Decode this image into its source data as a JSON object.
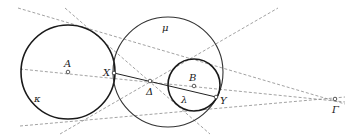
{
  "diagram": {
    "title": "",
    "circles": [
      {
        "id": "kappa",
        "label": "κ",
        "cx": 68,
        "cy": 72,
        "r": 47
      },
      {
        "id": "mu",
        "label": "μ",
        "cx": 168,
        "cy": 72,
        "r": 55
      },
      {
        "id": "lambda",
        "label": "λ",
        "cx": 194,
        "cy": 85,
        "r": 26
      }
    ],
    "points": {
      "A": {
        "label": "A",
        "x": 68,
        "y": 72
      },
      "B": {
        "label": "B",
        "x": 194,
        "y": 86
      },
      "X": {
        "label": "X",
        "x": 114,
        "y": 73
      },
      "Y": {
        "label": "Y",
        "x": 216,
        "y": 97
      },
      "Delta": {
        "label": "Δ",
        "x": 150,
        "y": 81
      },
      "Gamma": {
        "label": "Γ",
        "x": 335,
        "y": 99
      }
    },
    "labels": {
      "kappa": "κ",
      "mu": "μ",
      "lambda": "λ",
      "A": "A",
      "B": "B",
      "X": "X",
      "Y": "Y",
      "Delta": "Δ",
      "Gamma": "Γ"
    },
    "colors": {
      "circle": "#1a1a1a",
      "dashed": "#8a8a8a",
      "background": "#ffffff"
    }
  }
}
